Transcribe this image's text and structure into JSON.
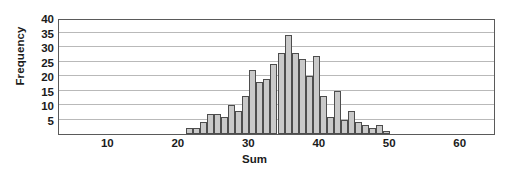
{
  "chart_data": {
    "type": "bar",
    "title": "",
    "xlabel": "Sum",
    "ylabel": "Frequency",
    "grid": true,
    "legend": false,
    "xlim": [
      3,
      65
    ],
    "ylim": [
      0,
      40
    ],
    "xticks": [
      10,
      20,
      30,
      40,
      50,
      60
    ],
    "yticks": [
      5,
      10,
      15,
      20,
      25,
      30,
      35,
      40
    ],
    "bin_width": 1,
    "categories": [
      21,
      22,
      23,
      24,
      25,
      26,
      27,
      28,
      29,
      30,
      31,
      32,
      33,
      34,
      35,
      36,
      37,
      38,
      39,
      40,
      41,
      42,
      43,
      44,
      45,
      46,
      47,
      48,
      49
    ],
    "values": [
      2,
      2,
      4,
      7,
      7,
      6,
      10,
      8,
      13,
      22,
      18,
      19,
      24,
      28,
      34,
      28,
      26,
      20,
      27,
      13,
      6,
      15,
      5,
      8,
      4,
      3,
      2,
      3,
      1
    ]
  },
  "axes": {
    "ylabel_text": "Frequency",
    "xlabel_text": "Sum",
    "ytick_labels": [
      "40",
      "35",
      "30",
      "25",
      "20",
      "15",
      "10",
      "5"
    ],
    "xtick_labels": [
      "10",
      "20",
      "30",
      "40",
      "50",
      "60"
    ]
  },
  "colors": {
    "bar_fill": "#c9c9c9",
    "bar_edge": "#4d4d4d",
    "grid": "#b9b9b9",
    "frame": "#5a5a5a",
    "text": "#1b1b1b",
    "background": "#ffffff"
  }
}
